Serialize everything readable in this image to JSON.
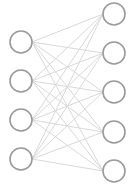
{
  "diagram": {
    "type": "neural-network",
    "colors": {
      "background": "#ffffff",
      "node_stroke": "#9a9a9a",
      "node_fill": "#ffffff",
      "edge": "#d9d9d9"
    },
    "node_radius": 11,
    "layers": [
      {
        "name": "input",
        "x": 21,
        "nodes": [
          42,
          81,
          120,
          159
        ]
      },
      {
        "name": "output",
        "x": 114,
        "nodes": [
          14,
          53,
          92,
          132,
          171
        ]
      }
    ],
    "connections": "fully-connected"
  }
}
